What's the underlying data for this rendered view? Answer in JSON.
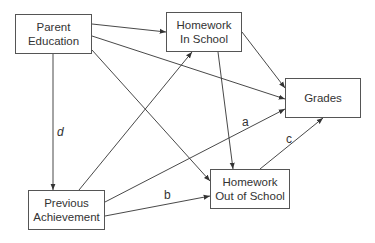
{
  "diagram": {
    "type": "path-diagram",
    "nodes": [
      {
        "id": "parent_education",
        "line1": "Parent",
        "line2": "Education"
      },
      {
        "id": "homework_in_school",
        "line1": "Homework",
        "line2": "In School"
      },
      {
        "id": "grades",
        "line1": "Grades",
        "line2": ""
      },
      {
        "id": "previous_achievement",
        "line1": "Previous",
        "line2": "Achievement"
      },
      {
        "id": "homework_out_of_school",
        "line1": "Homework",
        "line2": "Out of School"
      }
    ],
    "edges": [
      {
        "from": "parent_education",
        "to": "homework_in_school",
        "label": ""
      },
      {
        "from": "parent_education",
        "to": "grades",
        "label": ""
      },
      {
        "from": "parent_education",
        "to": "homework_out_of_school",
        "label": ""
      },
      {
        "from": "parent_education",
        "to": "previous_achievement",
        "label": "d"
      },
      {
        "from": "previous_achievement",
        "to": "homework_in_school",
        "label": ""
      },
      {
        "from": "previous_achievement",
        "to": "grades",
        "label": "a"
      },
      {
        "from": "previous_achievement",
        "to": "homework_out_of_school",
        "label": "b"
      },
      {
        "from": "homework_in_school",
        "to": "grades",
        "label": ""
      },
      {
        "from": "homework_in_school",
        "to": "homework_out_of_school",
        "label": ""
      },
      {
        "from": "homework_out_of_school",
        "to": "grades",
        "label": "c"
      }
    ],
    "labels": {
      "a": "a",
      "b": "b",
      "c": "c",
      "d": "d"
    },
    "colors": {
      "line": "#333333",
      "border": "#555555",
      "text": "#333333",
      "background": "#ffffff"
    }
  }
}
